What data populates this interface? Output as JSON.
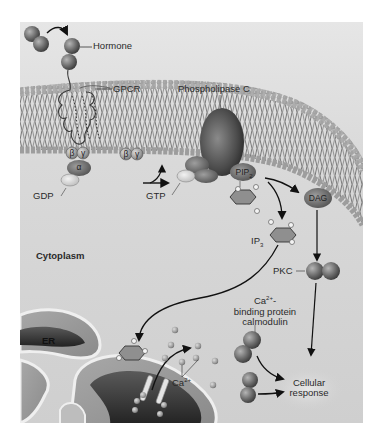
{
  "diagram": {
    "frame": {
      "x": 20,
      "y": 22,
      "width": 343,
      "height": 401,
      "background": "#d6d6d6"
    },
    "colors": {
      "background": "#ffffff",
      "cytoplasm": "#d4d4d4",
      "membrane_head": "#9a9a9a",
      "protein_dark": "#555555",
      "protein_mid": "#7a7a7a",
      "er_lumen": "#3a3a3a",
      "er_membrane": "#efefef",
      "arrow": "#111111",
      "text": "#2a2a2a"
    },
    "labels": {
      "hormone": "Hormone",
      "gpcr": "GPCR",
      "phospholipase_c": "Phospholipase C",
      "beta": "β",
      "gamma": "γ",
      "alpha": "α",
      "gdp": "GDP",
      "gtp": "GTP",
      "pip2": "PIP",
      "pip2_sub": "2",
      "dag": "DAG",
      "ip3": "IP",
      "ip3_sub": "3",
      "cytoplasm": "Cytoplasm",
      "er": "ER",
      "pkc": "PKC",
      "ca_binding_line1_prefix": "Ca",
      "ca_binding_line1_sup": "2+",
      "ca_binding_line1_suffix": "-",
      "ca_binding_line2": "binding protein",
      "ca_binding_line3": "calmodulin",
      "ca_ion": "Ca",
      "ca_ion_sup": "2+",
      "cellular_response_line1": "Cellular",
      "cellular_response_line2": "response"
    },
    "nodes": [
      {
        "id": "hormone",
        "label": "Hormone",
        "x": 95,
        "y": 47
      },
      {
        "id": "gpcr",
        "label": "GPCR",
        "x": 113,
        "y": 89
      },
      {
        "id": "g_protein_bound",
        "label": "β γ α + GDP",
        "x": 77,
        "y": 160
      },
      {
        "id": "g_beta_gamma_free",
        "label": "β γ",
        "x": 128,
        "y": 158
      },
      {
        "id": "g_alpha_gtp",
        "label": "GTP",
        "x": 185,
        "y": 175
      },
      {
        "id": "phospholipase_c",
        "label": "Phospholipase C",
        "x": 220,
        "y": 130
      },
      {
        "id": "pip2",
        "label": "PIP2",
        "x": 240,
        "y": 172
      },
      {
        "id": "dag",
        "label": "DAG",
        "x": 317,
        "y": 198
      },
      {
        "id": "ip3",
        "label": "IP3",
        "x": 275,
        "y": 242
      },
      {
        "id": "pkc",
        "label": "PKC",
        "x": 323,
        "y": 271
      },
      {
        "id": "er",
        "label": "ER",
        "x": 49,
        "y": 341
      },
      {
        "id": "ca_ion",
        "label": "Ca2+",
        "x": 182,
        "y": 377
      },
      {
        "id": "calmodulin",
        "label": "Ca2+-binding protein calmodulin",
        "x": 262,
        "y": 312
      },
      {
        "id": "cellular_response",
        "label": "Cellular response",
        "x": 308,
        "y": 389
      }
    ],
    "edges": [
      {
        "from": "hormone",
        "to": "gpcr"
      },
      {
        "from": "g_protein_bound",
        "to": "g_alpha_gtp",
        "note": "GDP exchanged for GTP, βγ released"
      },
      {
        "from": "g_alpha_gtp",
        "to": "phospholipase_c"
      },
      {
        "from": "pip2",
        "to": "dag"
      },
      {
        "from": "pip2",
        "to": "ip3"
      },
      {
        "from": "dag",
        "to": "pkc"
      },
      {
        "from": "ip3",
        "to": "er",
        "note": "IP3 binds ER channel"
      },
      {
        "from": "er",
        "to": "ca_ion",
        "note": "Ca2+ released"
      },
      {
        "from": "pkc",
        "to": "cellular_response"
      },
      {
        "from": "calmodulin",
        "to": "cellular_response"
      }
    ]
  }
}
